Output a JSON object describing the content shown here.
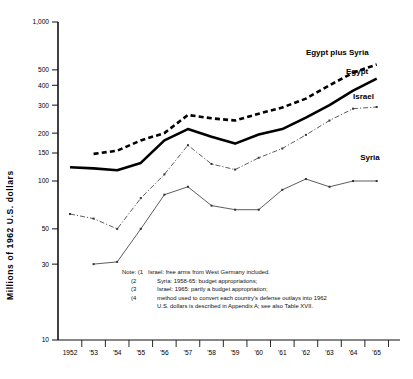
{
  "chart_data": {
    "type": "line",
    "title": "",
    "xlabel": "",
    "ylabel": "Millions of 1962 U.S. dollars",
    "yscale": "log",
    "ylim": [
      10,
      1000
    ],
    "yticks": [
      10,
      30,
      50,
      100,
      150,
      200,
      300,
      400,
      500,
      1000
    ],
    "ytick_labels": [
      "10",
      "30",
      "50",
      "100",
      "150",
      "200",
      "300",
      "400",
      "500",
      "1,000"
    ],
    "x": [
      1952,
      1953,
      1954,
      1955,
      1956,
      1957,
      1958,
      1959,
      1960,
      1961,
      1962,
      1963,
      1964,
      1965
    ],
    "xtick_labels": [
      "1952",
      "'53",
      "'54",
      "'55",
      "'56",
      "'57",
      "'58",
      "'59",
      "'60",
      "'61",
      "'62",
      "'63",
      "'64",
      "'65"
    ],
    "grid": false,
    "legend_position": "inline-right",
    "series": [
      {
        "name": "Egypt plus Syria",
        "style": "thick-dashed",
        "color": "#000000",
        "values": [
          null,
          148,
          155,
          180,
          200,
          260,
          248,
          240,
          265,
          290,
          330,
          400,
          480,
          540
        ]
      },
      {
        "name": "Egypt",
        "style": "thick-solid",
        "color": "#000000",
        "values": [
          122,
          120,
          117,
          130,
          180,
          212,
          190,
          172,
          196,
          212,
          250,
          300,
          370,
          440
        ]
      },
      {
        "name": "Israel",
        "style": "thin-dash-dot",
        "color": "#333333",
        "values": [
          62,
          58,
          50,
          78,
          110,
          168,
          128,
          118,
          140,
          160,
          195,
          240,
          285,
          292
        ]
      },
      {
        "name": "Syria",
        "style": "thin-solid",
        "color": "#333333",
        "values": [
          null,
          30,
          31,
          50,
          82,
          92,
          70,
          66,
          66,
          88,
          103,
          92,
          100,
          100
        ]
      }
    ],
    "annotations": [
      {
        "text": "Egypt plus Syria",
        "x": 1962.0,
        "y": 620
      },
      {
        "text": "Egypt",
        "x": 1963.7,
        "y": 470
      },
      {
        "text": "Israel",
        "x": 1964.0,
        "y": 330
      },
      {
        "text": "Syria",
        "x": 1964.3,
        "y": 135
      }
    ]
  },
  "note": {
    "label": "Note:",
    "items": [
      {
        "marker": "(1",
        "text": "Israel: free arms from West Germany included."
      },
      {
        "marker": "(2",
        "text": "Syria: 1958-65: budget appropriations;"
      },
      {
        "marker": "(3",
        "text": "Israel: 1965: partly a budget appropriation;"
      },
      {
        "marker": "(4",
        "text": "method used to convert each country's defense outlays into 1962"
      },
      {
        "marker": "",
        "text": "U.S. dollars is described in Appendix A; see also Table XVII."
      }
    ]
  }
}
